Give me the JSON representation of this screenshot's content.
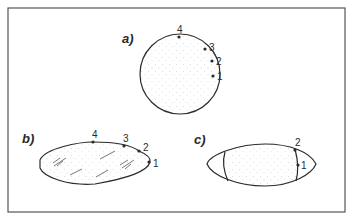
{
  "figure": {
    "panels": [
      {
        "id": "a",
        "label": "a)",
        "shape": "circle",
        "points": [
          "1",
          "2",
          "3",
          "4"
        ]
      },
      {
        "id": "b",
        "label": "b)",
        "shape": "flattened ellipse with shear marks",
        "points": [
          "1",
          "2",
          "3",
          "4"
        ]
      },
      {
        "id": "c",
        "label": "c)",
        "shape": "ellipse with central stippled band",
        "points": [
          "1",
          "2"
        ]
      }
    ],
    "colors": {
      "line": "#2a2a2a",
      "stipple": "#b8b8b8",
      "frame": "#555555",
      "background": "#ffffff"
    }
  }
}
